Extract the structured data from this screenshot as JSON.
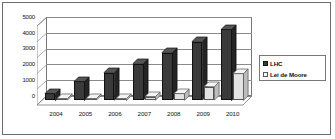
{
  "chart_data": {
    "type": "bar",
    "title": "",
    "subtitle": "",
    "xlabel": "",
    "ylabel": "",
    "categories": [
      "2004",
      "2005",
      "2006",
      "2007",
      "2008",
      "2009",
      "2010"
    ],
    "series": [
      {
        "name": "LHC",
        "color": "#3a3a3a",
        "values": [
          450,
          1200,
          1750,
          2300,
          3000,
          3700,
          4500
        ]
      },
      {
        "name": "Lei de Moore",
        "color": "#e3e3e3",
        "values": [
          60,
          90,
          130,
          230,
          430,
          850,
          1700
        ]
      }
    ],
    "ylim": [
      0,
      5000
    ],
    "yticks": [
      0,
      1000,
      2000,
      3000,
      4000,
      5000
    ],
    "ytick_labels": [
      "0",
      "1000",
      "2000",
      "3000",
      "4000",
      "5000"
    ],
    "grid": true,
    "legend_position": "right",
    "style": "3d-column"
  },
  "legend": {
    "entries": [
      {
        "label": "LHC",
        "swatch": "dark-square-swatch"
      },
      {
        "label": "Lei de Moore",
        "swatch": "light-square-swatch"
      }
    ]
  }
}
